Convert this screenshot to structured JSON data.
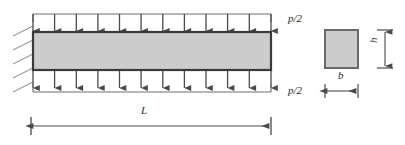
{
  "figure": {
    "type": "engineering-diagram",
    "labels": {
      "load_top": "p/2",
      "load_bottom": "p/2",
      "length": "L",
      "width": "b",
      "height": "h"
    },
    "beam": {
      "x": 33,
      "y": 32,
      "width": 238,
      "height": 38,
      "fill_color": "#cccccc",
      "stroke_color": "#3a3a3a",
      "stroke_width": 2.2
    },
    "support": {
      "kind": "fixed-hatched-wall",
      "x": 33,
      "y_top": 25,
      "y_bottom": 88,
      "hatch_count": 5,
      "hatch_length": 20,
      "hatch_color": "#9a9a9a"
    },
    "load_top": {
      "rail_y": 14,
      "arrow_tip_y": 31,
      "count": 12,
      "x_start": 33,
      "x_end": 271,
      "color": "#555555"
    },
    "load_bottom": {
      "rail_y": 88,
      "arrow_start_y": 71,
      "count": 12,
      "x_start": 33,
      "x_end": 271,
      "color": "#555555"
    },
    "length_dimension": {
      "y": 126,
      "x_start": 31,
      "x_end": 271,
      "tick_half_height": 9,
      "color": "#4a4a4a"
    },
    "cross_section": {
      "x": 325,
      "y": 30,
      "width": 33,
      "height": 38,
      "fill_color": "#cccccc",
      "stroke_color": "#6a6a6a",
      "height_dimension": {
        "x": 385,
        "y_top": 30,
        "y_bottom": 68,
        "tick_half_width": 8
      },
      "width_dimension": {
        "y": 91,
        "x_start": 325,
        "x_end": 358,
        "tick_half_height": 7
      }
    }
  }
}
